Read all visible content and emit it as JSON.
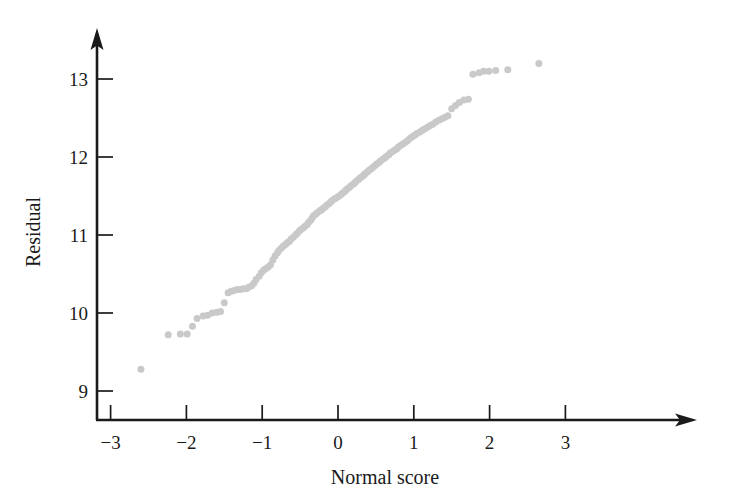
{
  "chart_data": {
    "type": "scatter",
    "title": "",
    "subtitle": "",
    "xlabel": "Normal score",
    "ylabel": "Residual",
    "xlim": [
      -3.35,
      3.45
    ],
    "ylim": [
      8.55,
      13.45
    ],
    "xticks": [
      -3,
      -2,
      -1,
      0,
      1,
      2,
      3
    ],
    "xtick_labels": [
      "−3",
      "−2",
      "−1",
      "0",
      "1",
      "2",
      "3"
    ],
    "yticks": [
      9,
      10,
      11,
      12,
      13
    ],
    "ytick_labels": [
      "9",
      "10",
      "11",
      "12",
      "13"
    ],
    "grid": false,
    "legend": null,
    "marker": {
      "shape": "circle",
      "color": "#c9c9c9",
      "size_px": 7
    },
    "axis_style": {
      "color": "#1a1a1a",
      "arrow_x": true,
      "arrow_y": true,
      "spine": "left-bottom-arrows"
    },
    "series": [
      {
        "name": "residuals",
        "x": [
          -2.6,
          -2.24,
          -2.08,
          -1.99,
          -1.92,
          -1.86,
          -1.78,
          -1.72,
          -1.66,
          -1.6,
          -1.55,
          -1.5,
          -1.45,
          -1.41,
          -1.37,
          -1.33,
          -1.29,
          -1.25,
          -1.21,
          -1.18,
          -1.14,
          -1.11,
          -1.08,
          -1.04,
          -1.01,
          -0.98,
          -0.95,
          -0.92,
          -0.89,
          -0.86,
          -0.83,
          -0.8,
          -0.78,
          -0.75,
          -0.72,
          -0.69,
          -0.67,
          -0.64,
          -0.62,
          -0.59,
          -0.56,
          -0.54,
          -0.51,
          -0.49,
          -0.46,
          -0.44,
          -0.41,
          -0.39,
          -0.36,
          -0.34,
          -0.32,
          -0.29,
          -0.27,
          -0.24,
          -0.22,
          -0.2,
          -0.17,
          -0.15,
          -0.12,
          -0.1,
          -0.08,
          -0.05,
          -0.03,
          0.0,
          0.03,
          0.05,
          0.08,
          0.1,
          0.12,
          0.15,
          0.17,
          0.2,
          0.22,
          0.24,
          0.27,
          0.29,
          0.32,
          0.34,
          0.36,
          0.39,
          0.41,
          0.44,
          0.46,
          0.49,
          0.51,
          0.54,
          0.56,
          0.59,
          0.62,
          0.64,
          0.67,
          0.69,
          0.72,
          0.75,
          0.78,
          0.8,
          0.83,
          0.86,
          0.89,
          0.92,
          0.95,
          0.98,
          1.01,
          1.04,
          1.08,
          1.11,
          1.14,
          1.18,
          1.21,
          1.25,
          1.29,
          1.33,
          1.37,
          1.41,
          1.45,
          1.5,
          1.55,
          1.6,
          1.66,
          1.72,
          1.78,
          1.86,
          1.92,
          1.99,
          2.08,
          2.24,
          2.65
        ],
        "y": [
          9.28,
          9.72,
          9.73,
          9.73,
          9.83,
          9.93,
          9.96,
          9.97,
          10.0,
          10.01,
          10.02,
          10.13,
          10.26,
          10.28,
          10.29,
          10.3,
          10.3,
          10.31,
          10.31,
          10.33,
          10.35,
          10.38,
          10.43,
          10.47,
          10.52,
          10.55,
          10.57,
          10.59,
          10.62,
          10.68,
          10.73,
          10.77,
          10.8,
          10.83,
          10.86,
          10.88,
          10.9,
          10.92,
          10.95,
          10.97,
          11.0,
          11.02,
          11.05,
          11.07,
          11.09,
          11.11,
          11.13,
          11.16,
          11.19,
          11.22,
          11.25,
          11.27,
          11.29,
          11.31,
          11.32,
          11.34,
          11.36,
          11.38,
          11.4,
          11.42,
          11.44,
          11.46,
          11.47,
          11.49,
          11.51,
          11.53,
          11.55,
          11.57,
          11.59,
          11.61,
          11.63,
          11.65,
          11.67,
          11.69,
          11.71,
          11.73,
          11.75,
          11.77,
          11.79,
          11.81,
          11.83,
          11.85,
          11.87,
          11.89,
          11.91,
          11.93,
          11.95,
          11.97,
          11.99,
          12.01,
          12.03,
          12.05,
          12.07,
          12.09,
          12.11,
          12.13,
          12.15,
          12.17,
          12.19,
          12.21,
          12.24,
          12.26,
          12.28,
          12.3,
          12.32,
          12.34,
          12.36,
          12.38,
          12.4,
          12.42,
          12.45,
          12.47,
          12.49,
          12.51,
          12.53,
          12.62,
          12.66,
          12.7,
          12.73,
          12.74,
          13.06,
          13.08,
          13.1,
          13.1,
          13.11,
          13.12,
          13.2
        ],
        "color": "#c9c9c9"
      }
    ]
  }
}
